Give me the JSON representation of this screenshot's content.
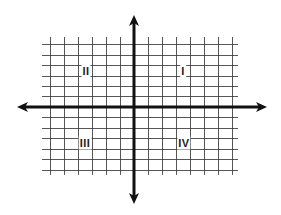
{
  "diagram": {
    "colors": {
      "background": "#ffffff",
      "grid": "#3a3a3a",
      "axis": "#111111",
      "label": "#222222"
    },
    "grid": {
      "x_lines": [
        50,
        64,
        78,
        92,
        106,
        120,
        148,
        162,
        176,
        190,
        204,
        218,
        232
      ],
      "y_lines": [
        44,
        55,
        65,
        76,
        86,
        96,
        117,
        128,
        138,
        149,
        159,
        170
      ],
      "x_extent": [
        42,
        238
      ],
      "y_extent": [
        37,
        175
      ]
    },
    "axes": {
      "origin": {
        "x": 134,
        "y": 107
      },
      "x_axis": {
        "from": 17,
        "to": 267
      },
      "y_axis": {
        "from": 15,
        "to": 204
      }
    },
    "quadrants": [
      {
        "id": "I",
        "label": "I",
        "x": 183,
        "y": 71
      },
      {
        "id": "II",
        "label": "II",
        "x": 86,
        "y": 71
      },
      {
        "id": "III",
        "label": "III",
        "x": 85,
        "y": 143
      },
      {
        "id": "IV",
        "label": "IV",
        "x": 184,
        "y": 143
      }
    ]
  }
}
